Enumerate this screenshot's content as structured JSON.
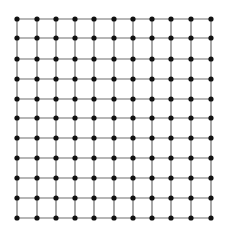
{
  "diagram": {
    "type": "lattice-grid",
    "rows": 11,
    "cols": 11,
    "x_positions": [
      17,
      37,
      56,
      75,
      94,
      114,
      133,
      152,
      171,
      191,
      211
    ],
    "y_positions": [
      19,
      38,
      59,
      79,
      99,
      118,
      138,
      158,
      178,
      198,
      218
    ],
    "node_radius": 2.6,
    "colors": {
      "background": "#ffffff",
      "edge": "#6f6f6f",
      "node": "#111111"
    }
  }
}
